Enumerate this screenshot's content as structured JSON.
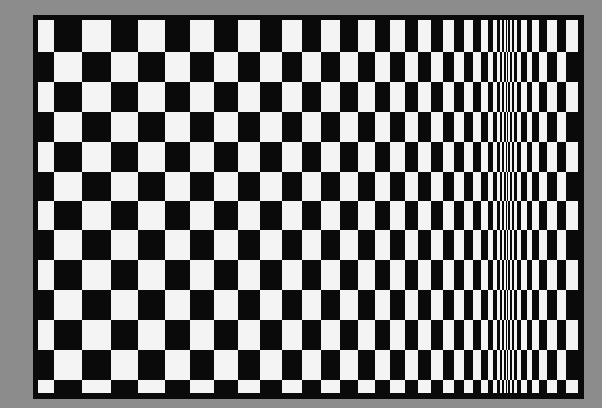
{
  "artwork": {
    "title": "Op-art checkerboard (movement in squares)",
    "background_color": "#8c8c8c",
    "frame_color": "#0a0a0a",
    "light_color": "#f4f4f4",
    "dark_color": "#0a0a0a"
  },
  "grid": {
    "column_boundaries": [
      38,
      54,
      82,
      111,
      138,
      165,
      190,
      214,
      238,
      260,
      282,
      302,
      321,
      340,
      358,
      375,
      390,
      405,
      418,
      431,
      443,
      454,
      464,
      473,
      481,
      488,
      493,
      497,
      500,
      502,
      504,
      506,
      507,
      508,
      510,
      512,
      514,
      517,
      521,
      527,
      532,
      539,
      547,
      557,
      566,
      578
    ],
    "row_boundaries": [
      20,
      52,
      82,
      112,
      142,
      172,
      201,
      230,
      260,
      290,
      320,
      350,
      380,
      393
    ],
    "top_left_cell": "light"
  }
}
